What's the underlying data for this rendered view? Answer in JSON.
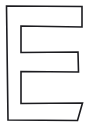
{
  "image": {
    "kind": "line-drawing",
    "subject": "letter-E",
    "description": "Outline drawing of the capital letter E",
    "character": "E",
    "width": 89,
    "height": 126,
    "background_color": "#ffffff",
    "stroke_color": "#1c1c20",
    "fill_color": "#ffffff",
    "stroke_width": 1.6,
    "style": "hand-drawn outline, unfilled",
    "alt_text": "Capital letter E drawn as a thin black outline on a white background"
  },
  "shape": {
    "name": "letter-E-outline",
    "closed": true,
    "points": [
      [
        6.5,
        6.0
      ],
      [
        82.0,
        6.5
      ],
      [
        82.0,
        27.0
      ],
      [
        21.0,
        26.0
      ],
      [
        21.0,
        52.5
      ],
      [
        78.0,
        52.0
      ],
      [
        78.5,
        72.0
      ],
      [
        21.0,
        71.5
      ],
      [
        21.0,
        103.5
      ],
      [
        82.5,
        103.0
      ],
      [
        77.5,
        120.5
      ],
      [
        8.0,
        120.0
      ]
    ],
    "vertex_count": 12
  },
  "parts": [
    {
      "name": "vertical-stem",
      "label": "Left vertical stem",
      "x_left": 6.5,
      "x_right": 21.0,
      "y_top": 6.0,
      "y_bottom": 120.0
    },
    {
      "name": "top-arm",
      "label": "Top horizontal arm",
      "x_left": 6.5,
      "x_right": 82.0,
      "y_top": 6.0,
      "y_bottom": 27.0
    },
    {
      "name": "middle-arm",
      "label": "Middle horizontal arm",
      "x_left": 21.0,
      "x_right": 78.5,
      "y_top": 52.0,
      "y_bottom": 72.0
    },
    {
      "name": "bottom-arm",
      "label": "Bottom horizontal arm",
      "x_left": 6.5,
      "x_right": 82.5,
      "y_top": 103.0,
      "y_bottom": 120.5,
      "right_edge": "slanted"
    }
  ]
}
